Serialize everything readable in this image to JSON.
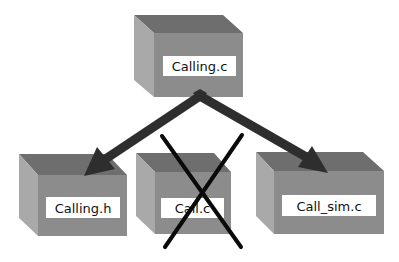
{
  "diagram": {
    "title": "",
    "colors": {
      "box_top": "#6e6e6e",
      "box_side": "#a9a9a9",
      "box_front": "#8c8c8c",
      "label_bg": "#ffffff",
      "arrow": "#2e2e2e",
      "cross": "#0a0a0a",
      "background": "#ffffff"
    },
    "nodes": [
      {
        "id": "calling-c",
        "label": "Calling.c",
        "status": "source"
      },
      {
        "id": "calling-h",
        "label": "Calling.h",
        "status": "dependency"
      },
      {
        "id": "call-c",
        "label": "Call.c",
        "status": "removed"
      },
      {
        "id": "call-sim-c",
        "label": "Call_sim.c",
        "status": "dependency"
      }
    ],
    "edges": [
      {
        "from": "calling-c",
        "to": "calling-h"
      },
      {
        "from": "calling-c",
        "to": "call-sim-c"
      }
    ],
    "crossed_out": [
      "call-c"
    ]
  }
}
